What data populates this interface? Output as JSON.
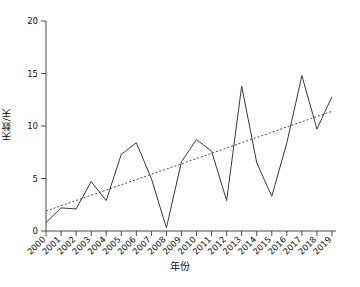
{
  "chart_data": {
    "type": "line",
    "title": "",
    "xlabel": "年份",
    "ylabel": "天数/天",
    "categories": [
      "2000",
      "2001",
      "2002",
      "2003",
      "2004",
      "2005",
      "2006",
      "2007",
      "2008",
      "2009",
      "2010",
      "2011",
      "2012",
      "2013",
      "2014",
      "2015",
      "2016",
      "2017",
      "2018",
      "2019"
    ],
    "series": [
      {
        "name": "天数",
        "style": "solid",
        "values": [
          0.8,
          2.2,
          2.1,
          4.7,
          2.9,
          7.3,
          8.4,
          5.0,
          0.3,
          6.6,
          8.7,
          7.6,
          2.9,
          13.8,
          6.5,
          3.3,
          8.4,
          14.8,
          9.7,
          12.8
        ]
      },
      {
        "name": "趋势线",
        "style": "dashed",
        "values": [
          1.9,
          2.4,
          2.9,
          3.4,
          3.9,
          4.4,
          4.9,
          5.4,
          5.9,
          6.4,
          6.9,
          7.4,
          7.9,
          8.4,
          8.9,
          9.4,
          9.9,
          10.4,
          10.9,
          11.4
        ]
      }
    ],
    "ylim": [
      0,
      20
    ],
    "yticks": [
      0,
      5,
      10,
      15,
      20
    ],
    "ytick_labels": [
      "0",
      "5",
      "10",
      "15",
      "20"
    ],
    "grid": false,
    "legend": "none",
    "colors": {
      "series_line": "#3a3a3a",
      "trend_line": "#4a4a4a",
      "axis": "#4a4a4a",
      "background": "#ffffff"
    }
  }
}
